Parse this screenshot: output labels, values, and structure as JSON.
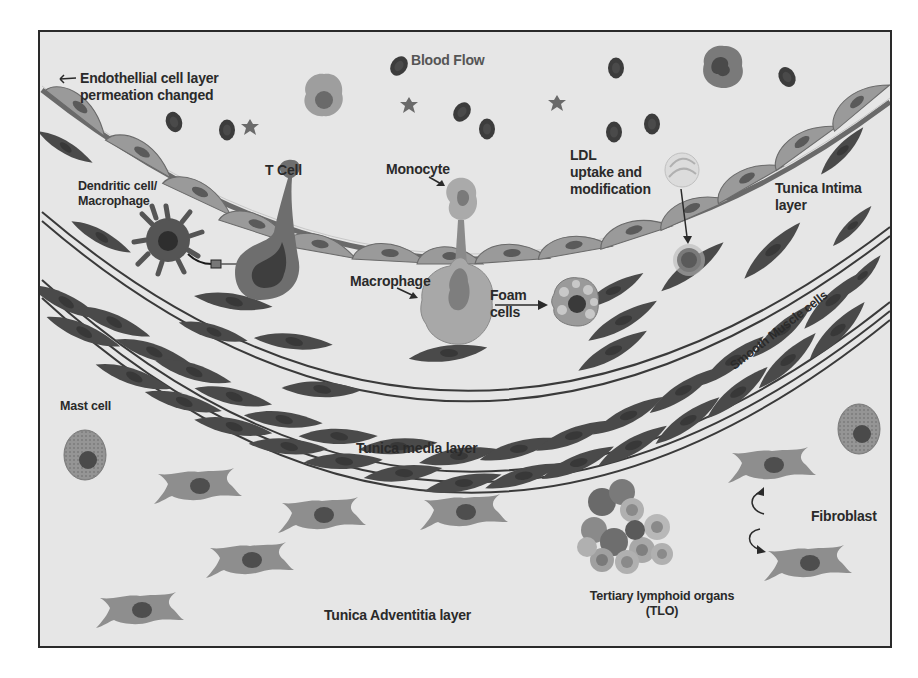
{
  "figure": {
    "colors": {
      "background": "#e6e6e6",
      "frame": "#2a2a2a",
      "endothelial_cell": "#9a9a9a",
      "smooth_muscle_cell": "#4a4a4a",
      "fibroblast": "#8e8e8e",
      "red_blood_cell": "#3c3c3c",
      "label_text": "#2a2a2a"
    }
  },
  "labels": {
    "blood_flow": "Blood Flow",
    "endothelial_line1": "Endothellial cell layer",
    "endothelial_line2": "permeation changed",
    "t_cell": "T Cell",
    "dendritic_line1": "Dendritic cell/",
    "dendritic_line2": "Macrophage",
    "monocyte": "Monocyte",
    "macrophage": "Macrophage",
    "foam_line1": "Foam",
    "foam_line2": "cells",
    "ldl_line1": "LDL",
    "ldl_line2": "uptake and",
    "ldl_line3": "modification",
    "tunica_intima_line1": "Tunica Intima",
    "tunica_intima_line2": "layer",
    "smooth_muscle": "Smooth Muscle cells",
    "tunica_media": "Tunica media layer",
    "mast_cell": "Mast cell",
    "fibroblast": "Fibroblast",
    "tlo_line1": "Tertiary lymphoid organs",
    "tlo_line2": "(TLO)",
    "tunica_adventitia": "Tunica Adventitia layer"
  }
}
